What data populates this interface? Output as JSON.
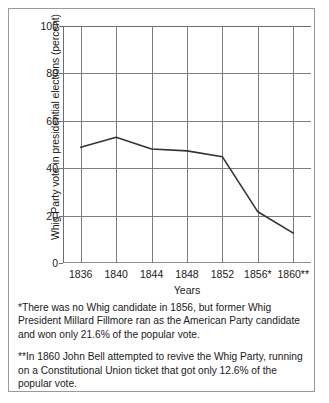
{
  "chart_data": {
    "type": "line",
    "title": "",
    "xlabel": "Years",
    "ylabel": "Whig Party vote in presidential elections (percent)",
    "categories": [
      "1836",
      "1840",
      "1844",
      "1848",
      "1852",
      "1856*",
      "1860**"
    ],
    "values": [
      48.8,
      53.1,
      48.1,
      47.3,
      44.8,
      21.6,
      12.6
    ],
    "ylim": [
      0,
      100
    ],
    "yticks": [
      0,
      20,
      40,
      60,
      80,
      100
    ],
    "ytick_labels": [
      "0",
      "20",
      "40",
      "60",
      "80",
      "100"
    ],
    "grid": "both",
    "legend": "none",
    "line_color": "#333333"
  },
  "notes": {
    "footnote_1": "*There was no Whig candidate in 1856, but former Whig President Millard Fillmore ran as the American Party candidate and won only 21.6% of the popular vote.",
    "footnote_2": "**In 1860 John Bell attempted to revive the Whig Party, running on a Constitutional Union ticket that got only 12.6% of the popular vote."
  }
}
